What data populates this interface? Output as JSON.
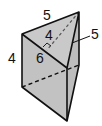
{
  "diagram": {
    "type": "triangular-prism",
    "colors": {
      "face": "#c4c4c4",
      "top_face": "#c9c9c9",
      "edge": "#111111",
      "background": "#ffffff"
    },
    "labels": {
      "top_edge": "5",
      "altitude": "4",
      "base_edge": "6",
      "right_edge": "5",
      "height": "4"
    },
    "annotations": {
      "right_angle_marker": true,
      "hidden_edges_dashed": true
    }
  }
}
